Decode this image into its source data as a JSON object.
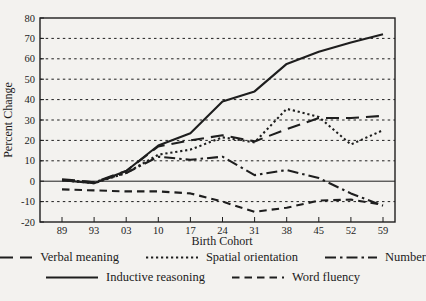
{
  "figure": {
    "background_color": "#f3f2ef",
    "line_color": "#1e1e1e",
    "text_color": "#1b1b1b"
  },
  "chart_data": {
    "type": "line",
    "title": "",
    "xlabel": "Birth Cohort",
    "ylabel": "Percent Change",
    "ylim": [
      -20,
      80
    ],
    "yticks": [
      80,
      70,
      60,
      50,
      40,
      30,
      20,
      10,
      0,
      -10,
      -20
    ],
    "grid": "horizontal dashed at each 10-unit tick, solid line at 0, full box spines",
    "legend_position": "bottom, two centered rows",
    "categories": [
      "89",
      "93",
      "03",
      "10",
      "17",
      "24",
      "31",
      "38",
      "45",
      "52",
      "59"
    ],
    "series": [
      {
        "name": "Verbal meaning",
        "line_style": "long-dash",
        "color": "#1e1e1e",
        "values": [
          1,
          -0.5,
          5,
          17,
          20,
          22.5,
          19.5,
          25.5,
          31,
          31,
          32
        ]
      },
      {
        "name": "Spatial orientation",
        "line_style": "dotted",
        "color": "#1e1e1e",
        "values": [
          0.5,
          -1,
          4,
          13,
          15.5,
          21.5,
          19,
          35.5,
          31.5,
          18,
          25
        ]
      },
      {
        "name": "Number",
        "line_style": "dash-dot",
        "color": "#1e1e1e",
        "values": [
          0.5,
          -0.5,
          4,
          12,
          10.5,
          12,
          3,
          5.5,
          1.5,
          -6,
          -12
        ]
      },
      {
        "name": "Inductive reasoning",
        "line_style": "solid",
        "color": "#1e1e1e",
        "values": [
          0.5,
          -1,
          5,
          17.5,
          23.5,
          39,
          44,
          57.5,
          63.5,
          68,
          72
        ]
      },
      {
        "name": "Word fluency",
        "line_style": "dashed",
        "color": "#1e1e1e",
        "values": [
          -4,
          -4.5,
          -5,
          -5,
          -6,
          -10,
          -15,
          -13,
          -9.5,
          -9,
          -11.5
        ]
      }
    ],
    "legend_rows": [
      [
        "Verbal meaning",
        "Spatial orientation",
        "Number"
      ],
      [
        "Inductive reasoning",
        "Word fluency"
      ]
    ]
  }
}
